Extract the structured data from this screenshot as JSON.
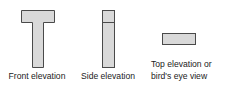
{
  "diagram": {
    "colors": {
      "fill": "#d9d9d9",
      "stroke": "#4a4a4a",
      "text": "#222222"
    },
    "views": [
      {
        "id": "front",
        "label_lines": [
          "Front elevation"
        ]
      },
      {
        "id": "side",
        "label_lines": [
          "Side elevation"
        ]
      },
      {
        "id": "top",
        "label_lines": [
          "Top elevation or",
          "bird's eye view"
        ]
      }
    ]
  }
}
